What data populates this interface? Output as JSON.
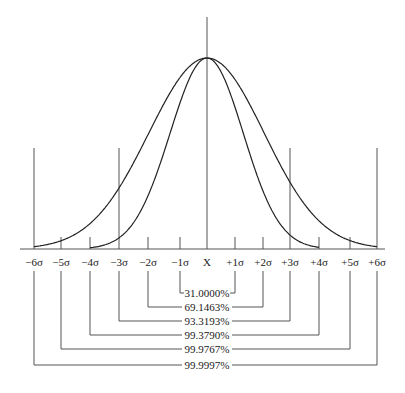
{
  "diagram": {
    "title": "",
    "center_label": "X",
    "axis_ticks": [
      {
        "label": "−6σ",
        "sigma": -6,
        "x": 34,
        "tall": true
      },
      {
        "label": "−5σ",
        "sigma": -5,
        "x": 61,
        "tall": false
      },
      {
        "label": "−4σ",
        "sigma": -4,
        "x": 90,
        "tall": false
      },
      {
        "label": "−3σ",
        "sigma": -3,
        "x": 119,
        "tall": true
      },
      {
        "label": "−2σ",
        "sigma": -2,
        "x": 148,
        "tall": false
      },
      {
        "label": "−1σ",
        "sigma": -1,
        "x": 180,
        "tall": false
      },
      {
        "label": "X",
        "sigma": 0,
        "x": 207,
        "tall": true
      },
      {
        "label": "+1σ",
        "sigma": 1,
        "x": 235,
        "tall": false
      },
      {
        "label": "+2σ",
        "sigma": 2,
        "x": 263,
        "tall": false
      },
      {
        "label": "+3σ",
        "sigma": 3,
        "x": 290,
        "tall": true
      },
      {
        "label": "+4σ",
        "sigma": 4,
        "x": 319,
        "tall": false
      },
      {
        "label": "+5σ",
        "sigma": 5,
        "x": 350,
        "tall": false
      },
      {
        "label": "+6σ",
        "sigma": 6,
        "x": 377,
        "tall": true
      }
    ],
    "coverage_brackets": [
      {
        "range": "±1σ",
        "from": -1,
        "to": 1,
        "label": "31.0000%",
        "y": 293
      },
      {
        "range": "±2σ",
        "from": -2,
        "to": 2,
        "label": "69.1463%",
        "y": 307
      },
      {
        "range": "±3σ",
        "from": -3,
        "to": 3,
        "label": "93.3193%",
        "y": 321
      },
      {
        "range": "±4σ",
        "from": -4,
        "to": 4,
        "label": "99.3790%",
        "y": 335
      },
      {
        "range": "±5σ",
        "from": -5,
        "to": 5,
        "label": "99.9767%",
        "y": 349
      },
      {
        "range": "±6σ",
        "from": -6,
        "to": 6,
        "label": "99.9997%",
        "y": 365
      }
    ],
    "curves": [
      {
        "name": "wide-distribution-curve",
        "description": "wider bell curve reaching baseline at ±6σ"
      },
      {
        "name": "narrow-distribution-curve",
        "description": "narrower bell curve reaching baseline near ±4σ"
      }
    ],
    "colors": {
      "line": "#555555",
      "curve": "#222222",
      "text": "#1a1a1a",
      "background": "#ffffff"
    }
  }
}
